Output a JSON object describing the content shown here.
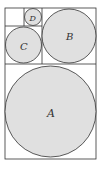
{
  "diagram": {
    "colors": {
      "circle_fill": "#e0e0e0",
      "stroke": "#333333",
      "background": "#ffffff"
    },
    "circles": [
      {
        "label": "A",
        "cx": 50.5,
        "cy": 111.5,
        "r": 45.5
      },
      {
        "label": "B",
        "cx": 69,
        "cy": 36,
        "r": 27
      },
      {
        "label": "C",
        "cx": 23.5,
        "cy": 45,
        "r": 18
      },
      {
        "label": "D",
        "cx": 33,
        "cy": 17,
        "r": 8.5
      }
    ]
  }
}
